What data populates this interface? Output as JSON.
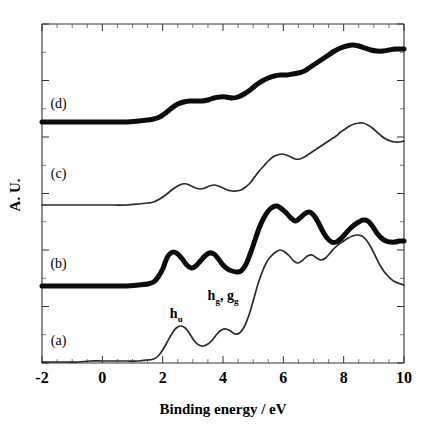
{
  "chart_data": {
    "type": "line",
    "title": "",
    "xlabel": "Binding energy / eV",
    "ylabel": "A. U.",
    "xlim": [
      -2,
      10
    ],
    "ylim": [
      0,
      1
    ],
    "grid": false,
    "legend_position": "inline-left",
    "xticks": [
      -2,
      0,
      2,
      4,
      6,
      8,
      10
    ],
    "xticklabels": [
      "-2",
      "0",
      "2",
      "4",
      "6",
      "8",
      "10"
    ],
    "xminor_step": 0.5,
    "yticks_count": 13,
    "yticklabels": [],
    "annotations": [
      {
        "id": "hu",
        "base": "h",
        "sub": "u",
        "x": 2.45,
        "y_px": 318
      },
      {
        "id": "hg_gg",
        "base": "h",
        "sub": "g",
        "base2": "g",
        "sub2": "g",
        "sep": ",",
        "x": 4.0,
        "y_px": 300
      }
    ],
    "series": [
      {
        "name": "(a)",
        "label": "(a)",
        "style": "thin",
        "label_x": -1.45,
        "label_y_px": 345,
        "baseline_px": 362,
        "x": [
          -2.0,
          -1.6,
          -1.2,
          -0.8,
          -0.4,
          0.0,
          0.4,
          0.8,
          1.2,
          1.5,
          1.7,
          1.85,
          2.0,
          2.15,
          2.3,
          2.45,
          2.6,
          2.75,
          2.9,
          3.05,
          3.2,
          3.35,
          3.5,
          3.65,
          3.8,
          3.95,
          4.1,
          4.25,
          4.4,
          4.55,
          4.7,
          4.85,
          5.0,
          5.15,
          5.3,
          5.45,
          5.6,
          5.75,
          5.9,
          6.05,
          6.2,
          6.35,
          6.5,
          6.65,
          6.8,
          6.95,
          7.1,
          7.25,
          7.4,
          7.55,
          7.7,
          7.85,
          8.0,
          8.15,
          8.3,
          8.45,
          8.6,
          8.75,
          8.9,
          9.05,
          9.2,
          9.35,
          9.5,
          9.65,
          9.8,
          10.0
        ],
        "y_px": [
          362,
          362,
          362,
          362,
          361,
          361,
          361,
          361,
          361,
          360,
          359,
          356,
          350,
          342,
          334,
          328,
          326,
          328,
          334,
          341,
          345,
          346,
          344,
          340,
          334,
          330,
          329,
          331,
          334,
          333,
          327,
          316,
          301,
          285,
          272,
          262,
          256,
          252,
          250,
          252,
          256,
          261,
          263,
          260,
          256,
          255,
          258,
          260,
          258,
          253,
          248,
          244,
          241,
          238,
          236,
          235,
          236,
          240,
          247,
          256,
          265,
          272,
          277,
          281,
          283,
          285
        ]
      },
      {
        "name": "(b)",
        "label": "(b)",
        "style": "thick",
        "label_x": -1.45,
        "label_y_px": 268,
        "baseline_px": 286,
        "x": [
          -2.0,
          -1.6,
          -1.2,
          -0.8,
          -0.4,
          0.0,
          0.4,
          0.8,
          1.2,
          1.5,
          1.7,
          1.85,
          2.0,
          2.1,
          2.2,
          2.35,
          2.5,
          2.65,
          2.8,
          2.95,
          3.1,
          3.25,
          3.4,
          3.55,
          3.7,
          3.85,
          4.0,
          4.15,
          4.3,
          4.45,
          4.6,
          4.75,
          4.9,
          5.05,
          5.2,
          5.35,
          5.5,
          5.65,
          5.8,
          5.95,
          6.1,
          6.25,
          6.4,
          6.55,
          6.7,
          6.85,
          7.0,
          7.15,
          7.3,
          7.45,
          7.6,
          7.75,
          7.9,
          8.05,
          8.2,
          8.35,
          8.5,
          8.65,
          8.8,
          8.95,
          9.1,
          9.25,
          9.4,
          9.55,
          9.7,
          9.85,
          10.0
        ],
        "y_px": [
          286,
          286,
          286,
          286,
          286,
          286,
          286,
          286,
          285,
          284,
          282,
          277,
          269,
          261,
          255,
          252,
          254,
          259,
          265,
          268,
          266,
          261,
          256,
          253,
          254,
          259,
          265,
          269,
          271,
          272,
          271,
          265,
          254,
          241,
          228,
          218,
          211,
          207,
          206,
          209,
          213,
          218,
          221,
          218,
          214,
          212,
          215,
          222,
          231,
          238,
          242,
          242,
          239,
          234,
          229,
          225,
          222,
          220,
          221,
          226,
          233,
          238,
          241,
          242,
          242,
          241,
          241
        ]
      },
      {
        "name": "(c)",
        "label": "(c)",
        "style": "thin",
        "label_x": -1.45,
        "label_y_px": 178,
        "baseline_px": 205,
        "x": [
          -2.0,
          -1.6,
          -1.2,
          -0.8,
          -0.4,
          0.0,
          0.4,
          0.8,
          1.2,
          1.5,
          1.7,
          1.9,
          2.1,
          2.3,
          2.5,
          2.65,
          2.8,
          2.95,
          3.1,
          3.25,
          3.4,
          3.55,
          3.7,
          3.85,
          4.0,
          4.15,
          4.3,
          4.45,
          4.6,
          4.75,
          4.9,
          5.05,
          5.2,
          5.35,
          5.5,
          5.65,
          5.8,
          5.95,
          6.1,
          6.25,
          6.4,
          6.55,
          6.7,
          6.85,
          7.0,
          7.15,
          7.3,
          7.45,
          7.6,
          7.75,
          7.9,
          8.05,
          8.2,
          8.35,
          8.5,
          8.65,
          8.8,
          8.95,
          9.1,
          9.25,
          9.4,
          9.55,
          9.7,
          9.85,
          10.0
        ],
        "y_px": [
          205,
          205,
          205,
          205,
          205,
          205,
          205,
          205,
          204,
          203,
          202,
          199,
          195,
          190,
          186,
          184,
          184,
          186,
          188,
          189,
          188,
          186,
          185,
          186,
          188,
          190,
          191,
          191,
          190,
          187,
          183,
          177,
          171,
          166,
          161,
          157,
          155,
          154,
          155,
          157,
          159,
          159,
          157,
          154,
          151,
          148,
          145,
          142,
          139,
          136,
          132,
          129,
          126,
          124,
          123,
          123,
          125,
          128,
          132,
          136,
          139,
          141,
          142,
          142,
          141
        ]
      },
      {
        "name": "(d)",
        "label": "(d)",
        "style": "thick",
        "label_x": -1.45,
        "label_y_px": 108,
        "baseline_px": 122,
        "x": [
          -2.0,
          -1.6,
          -1.2,
          -0.8,
          -0.4,
          0.0,
          0.4,
          0.8,
          1.2,
          1.5,
          1.7,
          1.9,
          2.1,
          2.3,
          2.5,
          2.7,
          2.9,
          3.1,
          3.3,
          3.5,
          3.7,
          3.9,
          4.1,
          4.3,
          4.5,
          4.7,
          4.9,
          5.1,
          5.3,
          5.5,
          5.7,
          5.9,
          6.1,
          6.3,
          6.5,
          6.7,
          6.9,
          7.1,
          7.3,
          7.5,
          7.7,
          7.9,
          8.1,
          8.3,
          8.5,
          8.7,
          8.9,
          9.1,
          9.3,
          9.5,
          9.7,
          9.85,
          10.0
        ],
        "y_px": [
          122,
          122,
          122,
          122,
          122,
          122,
          122,
          122,
          121,
          120,
          119,
          117,
          113,
          108,
          104,
          102,
          101,
          101,
          101,
          100,
          98,
          97,
          97,
          98,
          97,
          94,
          90,
          85,
          81,
          78,
          76,
          75,
          75,
          74,
          73,
          71,
          67,
          63,
          59,
          55,
          51,
          48,
          46,
          45,
          46,
          48,
          50,
          51,
          51,
          50,
          49,
          49,
          49
        ]
      }
    ]
  },
  "axes_geometry": {
    "left_px": 42,
    "right_px": 404,
    "top_px": 24,
    "bottom_px": 363
  }
}
